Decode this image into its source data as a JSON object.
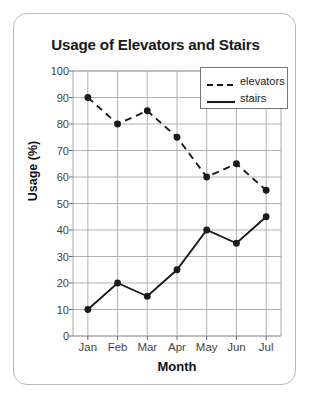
{
  "chart_data": {
    "type": "line",
    "title": "Usage of Elevators and Stairs",
    "xlabel": "Month",
    "ylabel": "Usage (%)",
    "categories": [
      "Jan",
      "Feb",
      "Mar",
      "Apr",
      "May",
      "Jun",
      "Jul"
    ],
    "series": [
      {
        "name": "elevators",
        "style": "dashed",
        "color": "#1a1a1a",
        "values": [
          90,
          80,
          85,
          75,
          60,
          65,
          55
        ]
      },
      {
        "name": "stairs",
        "style": "solid",
        "color": "#1a1a1a",
        "values": [
          10,
          20,
          15,
          25,
          40,
          35,
          45
        ]
      }
    ],
    "ylim": [
      0,
      100
    ],
    "ytick_step": 10,
    "yticks": [
      0,
      10,
      20,
      30,
      40,
      50,
      60,
      70,
      80,
      90,
      100
    ],
    "grid": true,
    "legend_position": "top-right",
    "marker": "filled-circle"
  },
  "colors": {
    "line": "#1a1a1a",
    "grid": "#a8a8a8",
    "axis": "#6a6a6a",
    "card_border": "#b9b9b9",
    "title_text": "#1a1a1a",
    "tick_text": "#444444",
    "background": "#ffffff"
  }
}
